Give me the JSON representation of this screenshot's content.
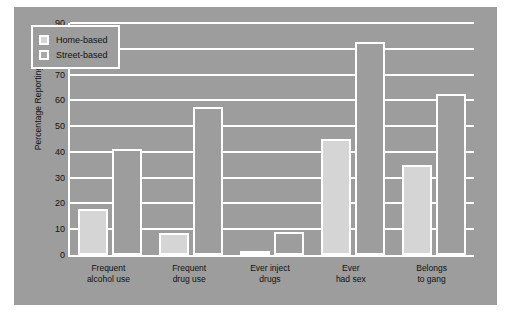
{
  "chart_data": {
    "type": "bar",
    "title": "",
    "xlabel": "",
    "ylabel": "Percentage Reporting",
    "ylim": [
      0,
      90
    ],
    "yticks": [
      0,
      10,
      20,
      30,
      40,
      50,
      60,
      70,
      80,
      90
    ],
    "grid": true,
    "legend_position": "top-left",
    "categories": [
      "Frequent alcohol use",
      "Frequent drug use",
      "Ever inject drugs",
      "Ever had sex",
      "Belongs to gang"
    ],
    "category_lines": [
      [
        "Frequent",
        "alcohol use"
      ],
      [
        "Frequent",
        "drug use"
      ],
      [
        "Ever inject",
        "drugs"
      ],
      [
        "Ever",
        "had sex"
      ],
      [
        "Belongs",
        "to gang"
      ]
    ],
    "series": [
      {
        "name": "Home-based",
        "color": "#d5d5d5",
        "values": [
          18,
          8.5,
          1,
          45,
          35
        ]
      },
      {
        "name": "Street-based",
        "color": "#9d9d9d",
        "values": [
          41,
          57.5,
          9,
          82.5,
          62.5
        ]
      }
    ]
  },
  "legend": {
    "items": [
      {
        "label": "Home-based"
      },
      {
        "label": "Street-based"
      }
    ]
  },
  "colors": {
    "page_background": "#ffffff",
    "panel_background": "#9d9d9d",
    "gridline": "#ffffff",
    "axis": "#ffffff",
    "text": "#111111",
    "home_bar": "#d5d5d5",
    "street_bar": "#9d9d9d"
  }
}
